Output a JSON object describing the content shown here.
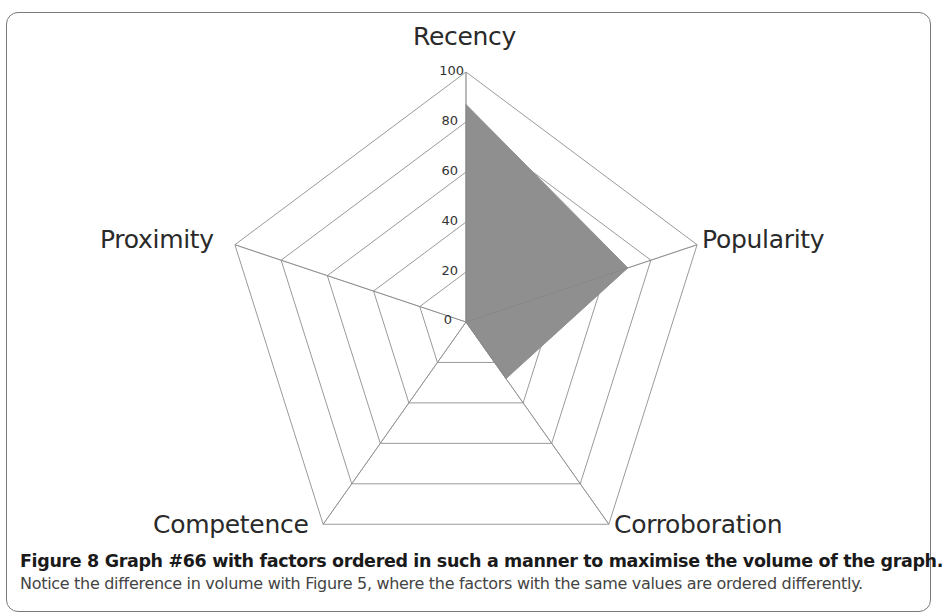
{
  "chart_data": {
    "type": "radar",
    "categories": [
      "Recency",
      "Popularity",
      "Corroboration",
      "Competence",
      "Proximity"
    ],
    "series": [
      {
        "name": "Graph #66",
        "values": [
          87,
          70,
          28,
          0,
          0
        ]
      }
    ],
    "title": "",
    "rlim": [
      0,
      100
    ],
    "ticks": [
      0,
      20,
      40,
      60,
      80,
      100
    ],
    "grid": true,
    "legend": "none",
    "fill_color": "#8f8f8f",
    "grid_color": "#9a9a9a"
  },
  "labels": {
    "recency": "Recency",
    "popularity": "Popularity",
    "corroboration": "Corroboration",
    "competence": "Competence",
    "proximity": "Proximity"
  },
  "ticks": {
    "t0": "0",
    "t20": "20",
    "t40": "40",
    "t60": "60",
    "t80": "80",
    "t100": "100"
  },
  "caption": {
    "title": "Figure 8 Graph #66 with factors ordered in such a manner to maximise the volume of the graph.",
    "body": "Notice the difference in volume with Figure 5, where the factors with the same values are ordered differently."
  }
}
